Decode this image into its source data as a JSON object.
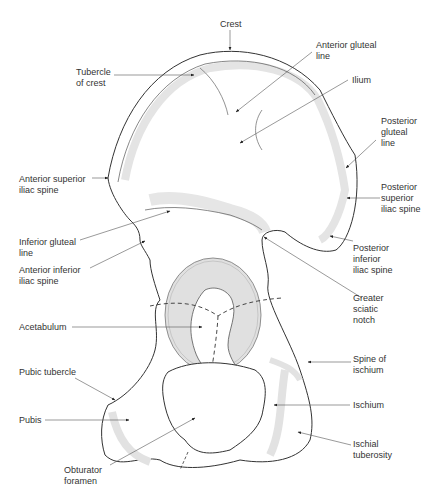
{
  "diagram": {
    "colors": {
      "outline": "#333333",
      "shade": "#e2e2e2",
      "acetabulum_fill": "#dcdcdc",
      "leader": "#555555",
      "text": "#333333"
    },
    "labels": [
      {
        "id": "crest",
        "text": "Crest"
      },
      {
        "id": "tubercle-of-crest",
        "text": "Tubercle\nof crest"
      },
      {
        "id": "anterior-gluteal-line",
        "text": "Anterior gluteal\nline"
      },
      {
        "id": "ilium",
        "text": "Ilium"
      },
      {
        "id": "posterior-gluteal-line",
        "text": "Posterior\ngluteal\nline"
      },
      {
        "id": "anterior-superior-iliac-spine",
        "text": "Anterior superior\niliac spine"
      },
      {
        "id": "posterior-superior-iliac-spine",
        "text": "Posterior\nsuperior\niliac spine"
      },
      {
        "id": "inferior-gluteal-line",
        "text": "Inferior gluteal\nline"
      },
      {
        "id": "anterior-inferior-iliac-spine",
        "text": "Anterior inferior\niliac spine"
      },
      {
        "id": "posterior-inferior-iliac-spine",
        "text": "Posterior\ninferior\niliac spine"
      },
      {
        "id": "greater-sciatic-notch",
        "text": "Greater\nsciatic\nnotch"
      },
      {
        "id": "acetabulum",
        "text": "Acetabulum"
      },
      {
        "id": "spine-of-ischium",
        "text": "Spine of\nischium"
      },
      {
        "id": "pubic-tubercle",
        "text": "Pubic tubercle"
      },
      {
        "id": "ischium",
        "text": "Ischium"
      },
      {
        "id": "pubis",
        "text": "Pubis"
      },
      {
        "id": "ischial-tuberosity",
        "text": "Ischial\ntuberosity"
      },
      {
        "id": "obturator-foramen",
        "text": "Obturator\nforamen"
      }
    ]
  }
}
